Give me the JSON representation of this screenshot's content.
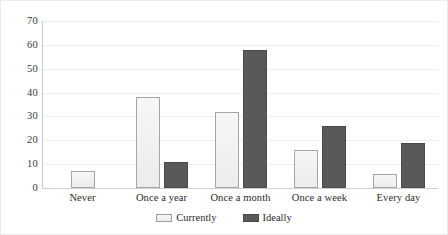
{
  "chart_data": {
    "type": "bar",
    "title": "",
    "subtitle": "",
    "xlabel": "",
    "ylabel": "",
    "categories": [
      "Never",
      "Once a year",
      "Once a month",
      "Once a week",
      "Every day"
    ],
    "series": [
      {
        "name": "Currently",
        "color": "#EFEFEF",
        "values": [
          7,
          38,
          32,
          16,
          6
        ]
      },
      {
        "name": "Ideally",
        "color": "#595959",
        "values": [
          0,
          11,
          58,
          26,
          19
        ]
      }
    ],
    "ylim": [
      0,
      70
    ],
    "ytick_step": 10,
    "yticks": [
      "70",
      "60",
      "50",
      "40",
      "30",
      "20",
      "10",
      "0"
    ],
    "grid": true,
    "grid_axis": "y",
    "legend": true,
    "legend_position": "bottom-center",
    "bar_border_color": "#A6A6A6",
    "gridline_color": "#F0EEEE",
    "axis_color": "#C9C7C7"
  },
  "legend": {
    "items": [
      {
        "label": "Currently",
        "swatch": "light-swatch-icon"
      },
      {
        "label": "Ideally",
        "swatch": "dark-swatch-icon"
      }
    ]
  }
}
